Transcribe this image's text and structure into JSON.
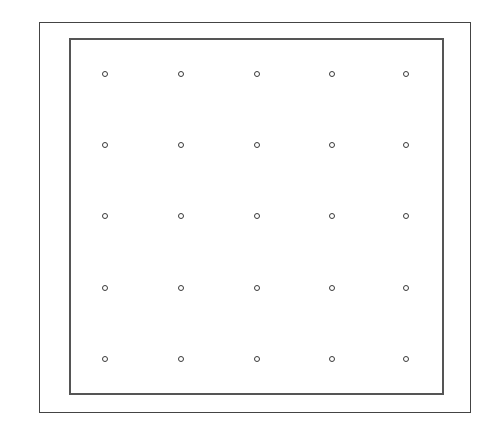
{
  "diagram": {
    "type": "dot-grid",
    "outer_frame": {
      "left": 39,
      "top": 22,
      "right": 471,
      "bottom": 413
    },
    "inner_frame": {
      "left": 69,
      "top": 38,
      "right": 444,
      "bottom": 395
    },
    "grid": {
      "rows": 5,
      "columns": 5,
      "column_x": [
        105,
        181,
        257,
        332,
        406
      ],
      "row_y": [
        74,
        145,
        216,
        288,
        359
      ]
    },
    "colors": {
      "background": "#ffffff",
      "frame": "#444444",
      "dot": "#3a3a3a"
    }
  }
}
